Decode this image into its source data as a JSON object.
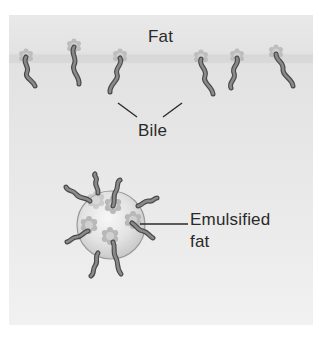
{
  "diagram": {
    "labels": {
      "fat": "Fat",
      "bile": "Bile",
      "emulsified_line1": "Emulsified",
      "emulsified_line2": "fat"
    },
    "colors": {
      "background": "#e6e6e6",
      "fat_band": "#d8d8d8",
      "bile_head": "#bdbdbd",
      "bile_tail_fill": "#8a8a8a",
      "bile_tail_outline": "#4a4a4a",
      "sphere_fill": "#e4e4e4",
      "sphere_outline": "#9a9a9a",
      "text": "#2a2a2a",
      "leader_line": "#2a2a2a"
    },
    "surface_bile_molecules": [
      {
        "head_x": 26,
        "head_y": 56,
        "tail_end_x": 35,
        "tail_end_y": 86
      },
      {
        "head_x": 74,
        "head_y": 46,
        "tail_end_x": 79,
        "tail_end_y": 84
      },
      {
        "head_x": 120,
        "head_y": 56,
        "tail_end_x": 110,
        "tail_end_y": 92
      },
      {
        "head_x": 201,
        "head_y": 57,
        "tail_end_x": 213,
        "tail_end_y": 94
      },
      {
        "head_x": 237,
        "head_y": 56,
        "tail_end_x": 231,
        "tail_end_y": 88
      },
      {
        "head_x": 276,
        "head_y": 52,
        "tail_end_x": 293,
        "tail_end_y": 86
      }
    ],
    "emulsified_droplet": {
      "cx": 111,
      "cy": 225,
      "r": 34,
      "bile_count": 8
    }
  }
}
